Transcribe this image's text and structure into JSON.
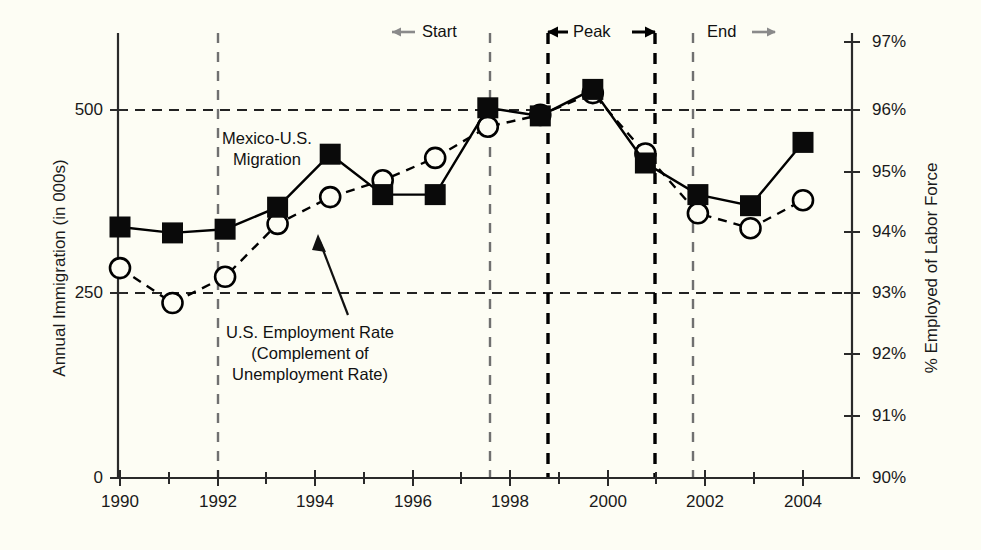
{
  "chart_data": {
    "type": "line",
    "title": "",
    "xlabel": "",
    "ylabel": "Annual Immigration (in 000s)",
    "ylabel_right": "% Employed of Labor Force",
    "x": [
      1991,
      1992,
      1993,
      1994,
      1995,
      1996,
      1997,
      1998,
      1999,
      2000,
      2001,
      2002,
      2003,
      2004
    ],
    "xlim": [
      1990,
      2005
    ],
    "ylim": [
      0,
      625
    ],
    "ylim_right": [
      90,
      97
    ],
    "xticks": [
      "1990",
      "1991",
      "1992",
      "1993",
      "1994",
      "1995",
      "1996",
      "1997",
      "1998",
      "1999",
      "2000",
      "2001",
      "2002",
      "2003",
      "2004",
      "2005"
    ],
    "xtick_labels_shown": [
      "1990",
      "1992",
      "1994",
      "1996",
      "1998",
      "2000",
      "2002",
      "2004"
    ],
    "yticks_left": [
      "0",
      "250",
      "500"
    ],
    "yticks_right": [
      "90%",
      "91%",
      "92%",
      "93%",
      "94%",
      "95%",
      "96%",
      "97%"
    ],
    "grid": "horizontal dashed at 250 and 500 (93% and 96%)",
    "legend": "inline annotations",
    "series": [
      {
        "name": "Mexico-U.S. Migration",
        "axis": "left",
        "marker": "filled-square",
        "line": "solid",
        "color": "#000000",
        "values": [
          341,
          333,
          338,
          368,
          440,
          385,
          385,
          503,
          492,
          528,
          428,
          385,
          370,
          456
        ]
      },
      {
        "name": "U.S. Employment Rate (Complement of Unemployment Rate)",
        "axis": "right",
        "marker": "open-circle",
        "line": "dashed",
        "color": "#000000",
        "values": [
          93.37,
          92.81,
          93.23,
          94.08,
          94.51,
          94.78,
          95.14,
          95.64,
          95.83,
          96.18,
          95.21,
          94.25,
          94.01,
          94.46
        ]
      }
    ],
    "annotations": [
      {
        "name": "start-marker",
        "label": "Start",
        "arrow": "left",
        "arrow_color": "#808080",
        "x": 1997.5,
        "line": "dashed-gray"
      },
      {
        "name": "peak-marker",
        "label": "Peak",
        "arrow": "both",
        "arrow_color": "#000000",
        "x_from": 1998.9,
        "x_to": 2001.0,
        "line": "dashed-black"
      },
      {
        "name": "end-marker",
        "label": "End",
        "arrow": "right",
        "arrow_color": "#808080",
        "x": 2001.75,
        "line": "dashed-gray"
      },
      {
        "name": "migration-series-label",
        "label": "Mexico-U.S.\nMigration"
      },
      {
        "name": "employment-series-label",
        "label": "U.S. Employment Rate\n(Complement of\nUnemployment Rate)"
      }
    ],
    "vertical_lines": [
      {
        "name": "vline-1992",
        "x": 1992,
        "style": "dashed",
        "color": "#777777"
      },
      {
        "name": "vline-start",
        "x": 1997.5,
        "style": "dashed",
        "color": "#777777"
      },
      {
        "name": "vline-peak-begin",
        "x": 1998.9,
        "style": "dashed",
        "color": "#000000"
      },
      {
        "name": "vline-peak-end",
        "x": 2001.0,
        "style": "dashed",
        "color": "#000000"
      },
      {
        "name": "vline-end",
        "x": 2001.75,
        "style": "dashed",
        "color": "#777777"
      }
    ]
  },
  "axes": {
    "left_title": "Annual Immigration (in 000s)",
    "right_title": "% Employed of Labor Force",
    "left_ticks": [
      {
        "label": "500",
        "y": 110
      },
      {
        "label": "250",
        "y": 293
      },
      {
        "label": "0",
        "y": 478
      }
    ],
    "right_ticks": [
      {
        "label": "97%",
        "y": 42
      },
      {
        "label": "96%",
        "y": 110
      },
      {
        "label": "95%",
        "y": 172
      },
      {
        "label": "94%",
        "y": 232
      },
      {
        "label": "93%",
        "y": 293
      },
      {
        "label": "92%",
        "y": 354
      },
      {
        "label": "91%",
        "y": 416
      },
      {
        "label": "90%",
        "y": 478
      }
    ],
    "x_ticks": [
      {
        "label": "1990",
        "x": 120
      },
      {
        "label": "1992",
        "x": 218
      },
      {
        "label": "1994",
        "x": 315
      },
      {
        "label": "1996",
        "x": 413
      },
      {
        "label": "1998",
        "x": 510
      },
      {
        "label": "2000",
        "x": 608
      },
      {
        "label": "2002",
        "x": 705
      },
      {
        "label": "2004",
        "x": 803
      }
    ]
  },
  "labels": {
    "migration_line1": "Mexico-U.S.",
    "migration_line2": "Migration",
    "employment_line1": "U.S. Employment Rate",
    "employment_line2": "(Complement of",
    "employment_line3": "Unemployment Rate)",
    "start": "Start",
    "peak": "Peak",
    "end": "End"
  },
  "colors": {
    "background": "#fdfdf4",
    "ink": "#1a1a1a",
    "gray_dash": "#777777",
    "black_dash": "#000000",
    "gray_arrow": "#808080"
  }
}
